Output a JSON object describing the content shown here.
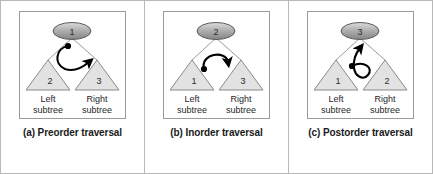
{
  "figure": {
    "border_color": "#b9b9b9",
    "background": "#ffffff"
  },
  "colors": {
    "root_fill_light": "#d9d9d9",
    "root_fill_dark": "#8f8f8f",
    "root_stroke": "#5a5a5a",
    "triangle_fill": "#e2e2e2",
    "triangle_stroke": "#8a8a8a",
    "edge_stroke": "#9a9a9a",
    "arrow_color": "#000000",
    "text_color": "#1a1a1a",
    "panel_divider": "#b9b9b9",
    "box_border": "#9a9a9a"
  },
  "labels": {
    "left_line1": "Left",
    "left_line2": "subtree",
    "right_line1": "Right",
    "right_line2": "subtree"
  },
  "panels": [
    {
      "id": "preorder",
      "caption": "(a) Preorder traversal",
      "root_value": "1",
      "left_value": "2",
      "right_value": "3",
      "arrow_name": "preorder-arrow",
      "arrow_description": "dot below root, curve sweeps left and down then up to the right subtree"
    },
    {
      "id": "inorder",
      "caption": "(b) Inorder traversal",
      "root_value": "2",
      "left_value": "1",
      "right_value": "3",
      "arrow_name": "inorder-arrow",
      "arrow_description": "dot at left, curve arcs up over the root and points down at the right subtree"
    },
    {
      "id": "postorder",
      "caption": "(c) Postorder traversal",
      "root_value": "3",
      "left_value": "1",
      "right_value": "2",
      "arrow_name": "postorder-arrow",
      "arrow_description": "dot at left, curve loops right and around then points up at the root"
    }
  ]
}
